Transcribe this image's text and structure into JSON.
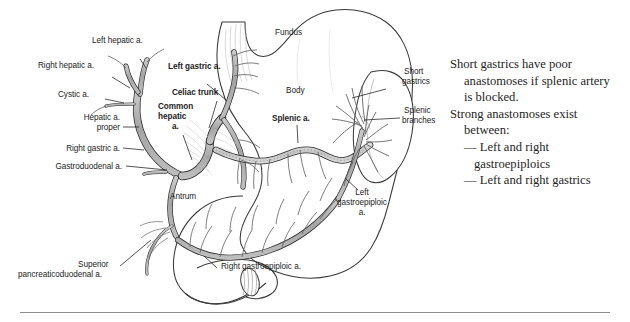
{
  "figure": {
    "colors": {
      "vessel_fill": "#a9a9a9",
      "vessel_fill_light": "#c9c9c9",
      "outline": "#2b2b2b",
      "organ_line": "#3a3a3a",
      "text": "#1c1c1c",
      "rule": "#8d8d92",
      "background": "#ffffff"
    },
    "labels": {
      "left_hepatic": "Left hepatic a.",
      "right_hepatic": "Right hepatic a.",
      "cystic": "Cystic a.",
      "hepatic_proper_l1": "Hepatic a.",
      "hepatic_proper_l2": "proper",
      "right_gastric": "Right gastric a.",
      "gastroduodenal": "Gastroduodenal a.",
      "superior_pd_l1": "Superior",
      "superior_pd_l2": "pancreaticoduodenal a.",
      "left_gastric": "Left gastric a.",
      "celiac_trunk": "Celiac trunk",
      "common_hepatic_l1": "Common",
      "common_hepatic_l2": "hepatic",
      "common_hepatic_l3": "a.",
      "splenic": "Splenic a.",
      "fundus": "Fundus",
      "body": "Body",
      "antrum": "Antrum",
      "short_gastrics_l1": "Short",
      "short_gastrics_l2": "gastrics",
      "splenic_branches_l1": "Splenic",
      "splenic_branches_l2": "branches",
      "left_gastroepiploic_l1": "Left",
      "left_gastroepiploic_l2": "gastroepiploic",
      "left_gastroepiploic_l3": "a.",
      "right_gastroepiploic": "Right gastroepiploic a."
    }
  },
  "notes": {
    "line1": "Short gastrics have poor",
    "line2": "anastomoses if splenic artery",
    "line3": "is blocked.",
    "line4": "Strong anastomoses exist",
    "line5": "between:",
    "line6": "— Left and right",
    "line7": "gastroepiploics",
    "line8": "— Left and right gastrics"
  }
}
